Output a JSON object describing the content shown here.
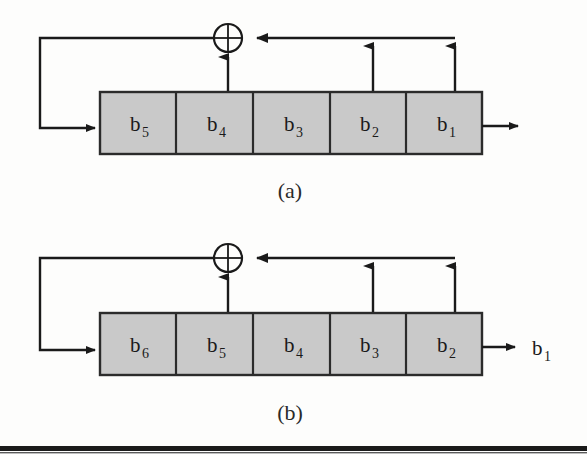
{
  "page": {
    "background_color": "#fdfdfc",
    "ink_color": "#1a1a1a",
    "cell_fill_color": "#c9c9c9",
    "cell_border_color": "#2b2b2b"
  },
  "figures": [
    {
      "id": "figure-a",
      "caption": "(a)",
      "register_cells": [
        {
          "base": "b",
          "sub": "5"
        },
        {
          "base": "b",
          "sub": "4"
        },
        {
          "base": "b",
          "sub": "3"
        },
        {
          "base": "b",
          "sub": "2"
        },
        {
          "base": "b",
          "sub": "1"
        }
      ],
      "xor_symbol": "⊕",
      "output_label": "",
      "tap_count": 2,
      "feedback": "left-loop"
    },
    {
      "id": "figure-b",
      "caption": "(b)",
      "register_cells": [
        {
          "base": "b",
          "sub": "6"
        },
        {
          "base": "b",
          "sub": "5"
        },
        {
          "base": "b",
          "sub": "4"
        },
        {
          "base": "b",
          "sub": "3"
        },
        {
          "base": "b",
          "sub": "2"
        }
      ],
      "xor_symbol": "⊕",
      "output_label_base": "b",
      "output_label_sub": "1",
      "tap_count": 2,
      "feedback": "left-loop"
    }
  ],
  "rule": {
    "present": true
  }
}
